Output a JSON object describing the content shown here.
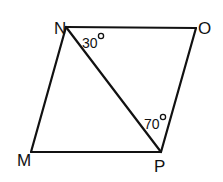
{
  "diagram": {
    "type": "parallelogram",
    "vertices": [
      {
        "label": "N",
        "x": 66,
        "y": 27,
        "label_x": 54,
        "label_y": 34
      },
      {
        "label": "O",
        "x": 196,
        "y": 28,
        "label_x": 198,
        "label_y": 34
      },
      {
        "label": "P",
        "x": 161,
        "y": 152,
        "label_x": 154,
        "label_y": 172
      },
      {
        "label": "M",
        "x": 31,
        "y": 152,
        "label_x": 17,
        "label_y": 166
      }
    ],
    "edges": [
      [
        "N",
        "O"
      ],
      [
        "O",
        "P"
      ],
      [
        "P",
        "M"
      ],
      [
        "M",
        "N"
      ]
    ],
    "diagonals": [
      [
        "N",
        "P"
      ]
    ],
    "angles": [
      {
        "text": "30",
        "vertex": "N",
        "between": [
          "O",
          "P"
        ],
        "value": 30,
        "unit": "°",
        "x": 82,
        "y": 48,
        "deg_x": 101,
        "deg_y": 36
      },
      {
        "text": "70",
        "vertex": "P",
        "between": [
          "N",
          "O"
        ],
        "value": 70,
        "unit": "°",
        "x": 144,
        "y": 129,
        "deg_x": 163,
        "deg_y": 117
      }
    ]
  }
}
